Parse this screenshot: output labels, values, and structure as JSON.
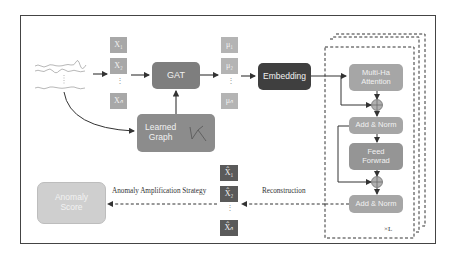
{
  "diagram": {
    "inputs": {
      "signals_label": "multivariate time series",
      "x_items": [
        "X₁",
        "X₂",
        "Xₙ"
      ]
    },
    "gat": {
      "label": "GAT"
    },
    "learned_graph": {
      "label_line1": "Learned",
      "label_line2": "Graph"
    },
    "mu_items": [
      "μ₁",
      "μ₂",
      "μₙ"
    ],
    "embedding": {
      "label": "Embedding"
    },
    "transformer": {
      "attention_line1": "Multi-Ha",
      "attention_line2": "Attention",
      "add_norm_1": "Add & Norm",
      "feed_forward_line1": "Feed",
      "feed_forward_line2": "Forwrad",
      "add_norm_2": "Add & Norm",
      "repeat_label": "×L"
    },
    "reconstruction": {
      "label": "Reconstruction",
      "xhat_items": [
        "X̂₁",
        "X̂₂",
        "X̂ₙ"
      ]
    },
    "amplification": {
      "label": "Anomaly Amplification Strategy"
    },
    "anomaly_score": {
      "label_line1": "Anomaly",
      "label_line2": "Score"
    },
    "ellipsis": "⋮",
    "colors": {
      "x_box": "#a8a8a8",
      "mu_box": "#b4b4b4",
      "gat": "#7e7e7e",
      "learned_graph": "#8c8c8c",
      "embedding": "#3f3f3f",
      "transformer_block": "#a6a6a6",
      "xhat_box": "#5a5a5a",
      "anomaly_score": "#cfcfcf",
      "plus_node": "#b0b0b0",
      "line": "#333333"
    }
  }
}
